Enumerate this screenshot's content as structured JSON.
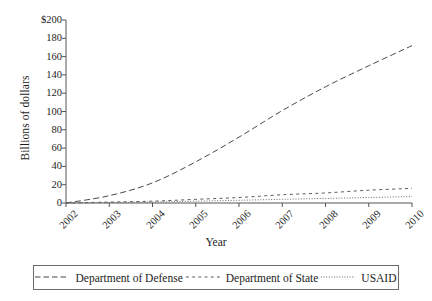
{
  "chart_data": {
    "type": "line",
    "title": "",
    "xlabel": "Year",
    "ylabel": "Billions of dollars",
    "x": [
      2002,
      2003,
      2004,
      2005,
      2006,
      2007,
      2008,
      2009,
      2010
    ],
    "xticklabels": [
      "2002",
      "2003",
      "2004",
      "2005",
      "2006",
      "2007",
      "2008",
      "2009",
      "2010"
    ],
    "yticklabels": [
      "0",
      "20",
      "40",
      "60",
      "80",
      "100",
      "120",
      "140",
      "160",
      "180",
      "$200"
    ],
    "yticks": [
      0,
      20,
      40,
      60,
      80,
      100,
      120,
      140,
      160,
      180,
      200
    ],
    "ylim": [
      0,
      200
    ],
    "xlim": [
      2002,
      2010
    ],
    "grid": false,
    "legend_position": "below",
    "series": [
      {
        "name": "Department of Defense",
        "linestyle": "dashed",
        "color": "#4a4a4a",
        "values": [
          0,
          8,
          22,
          45,
          72,
          101,
          127,
          150,
          172
        ]
      },
      {
        "name": "Department of State",
        "linestyle": "dashed-short",
        "color": "#5a5a5a",
        "values": [
          0,
          1,
          2,
          4,
          6,
          9,
          11,
          14,
          16
        ]
      },
      {
        "name": "USAID",
        "linestyle": "dotted",
        "color": "#6a6a6a",
        "values": [
          0,
          0.5,
          1,
          2,
          3,
          4,
          5,
          6,
          7
        ]
      }
    ]
  },
  "legend": {
    "items": [
      {
        "label": "Department of Defense",
        "key": "dashed-long-key"
      },
      {
        "label": "Department of State",
        "key": "dashed-short-key"
      },
      {
        "label": "USAID",
        "key": "dotted-key"
      }
    ]
  },
  "axes": {
    "y_title": "Billions of dollars",
    "x_title": "Year"
  }
}
